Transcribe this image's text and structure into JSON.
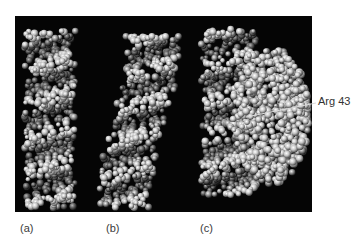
{
  "figure": {
    "panel_labels": [
      "(a)",
      "(b)",
      "(c)"
    ],
    "annotation": "Arg 43",
    "colors": {
      "background": "#ffffff",
      "panel": "#050505",
      "sphere_light": "#e6e6e6",
      "sphere_mid": "#8c8c8c",
      "sphere_dark": "#2a2a2a",
      "label_text": "#3a3a3a"
    },
    "models": [
      {
        "id": "a",
        "description": "DNA double helix space-filling model",
        "cx": 35,
        "top": 15,
        "bottom": 192,
        "width": 52,
        "curve": 0,
        "seed": 11
      },
      {
        "id": "b",
        "description": "Bent DNA double helix space-filling model",
        "cx": 120,
        "top": 20,
        "bottom": 192,
        "width": 54,
        "curve": 1,
        "seed": 23
      },
      {
        "id": "c",
        "description": "DNA bound to protein space-filling model",
        "cx": 215,
        "top": 12,
        "bottom": 180,
        "width": 58,
        "curve": 0,
        "seed": 37,
        "protein": {
          "cx": 256,
          "cy": 100,
          "rx": 38,
          "ry": 68
        }
      }
    ]
  }
}
